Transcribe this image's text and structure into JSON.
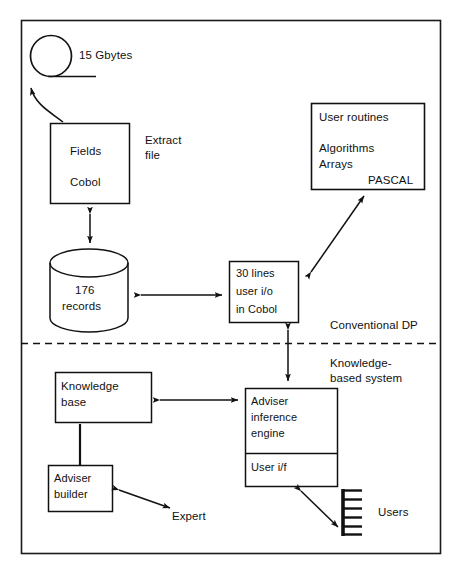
{
  "figure": {
    "frame": {
      "stroke": "#1a1a1a"
    },
    "divider": {
      "label_above": "Conventional DP",
      "label_below_line1": "Knowledge-",
      "label_below_line2": "based system",
      "style": "dashed"
    }
  },
  "nodes": {
    "tape": {
      "label": "15 Gbytes",
      "shape": "tape-reel"
    },
    "extract_box": {
      "line1": "Fields",
      "line2": "Cobol",
      "shape": "rectangle"
    },
    "extract_caption": {
      "line1": "Extract",
      "line2": "file"
    },
    "database": {
      "line1": "176",
      "line2": "records",
      "shape": "cylinder"
    },
    "user_io": {
      "line1": "30 lines",
      "line2": "user i/o",
      "line3": "in Cobol",
      "shape": "rectangle"
    },
    "pascal_box": {
      "line1": "User routines",
      "line2": "Algorithms",
      "line3": "Arrays",
      "line4": "PASCAL",
      "shape": "rectangle"
    },
    "knowledge_base": {
      "line1": "Knowledge",
      "line2": "base",
      "shape": "rectangle"
    },
    "adviser_builder": {
      "line1": "Adviser",
      "line2": "builder",
      "shape": "rectangle"
    },
    "adviser_engine": {
      "line1": "Adviser",
      "line2": "inference",
      "line3": "engine",
      "shape": "rectangle"
    },
    "user_if": {
      "label": "User i/f",
      "shape": "rectangle-section"
    },
    "expert": {
      "label": "Expert"
    },
    "users": {
      "label": "Users",
      "icon": "terminal-stack-icon"
    }
  },
  "connectors": [
    {
      "name": "tape-to-extract",
      "kind": "curved-arrow",
      "direction": "up"
    },
    {
      "name": "extract-to-database",
      "kind": "double-arrow",
      "direction": "vertical"
    },
    {
      "name": "database-to-user-io",
      "kind": "double-arrow",
      "direction": "horizontal"
    },
    {
      "name": "user-io-to-pascal",
      "kind": "double-arrow",
      "direction": "diagonal"
    },
    {
      "name": "user-io-to-adviser-engine",
      "kind": "double-arrow",
      "direction": "vertical"
    },
    {
      "name": "knowledge-base-to-adviser-engine",
      "kind": "double-arrow",
      "direction": "horizontal"
    },
    {
      "name": "knowledge-base-to-adviser-builder",
      "kind": "plain-line",
      "direction": "vertical"
    },
    {
      "name": "adviser-builder-to-expert",
      "kind": "double-arrow",
      "direction": "diagonal"
    },
    {
      "name": "user-if-to-users",
      "kind": "double-arrow",
      "direction": "diagonal"
    }
  ]
}
